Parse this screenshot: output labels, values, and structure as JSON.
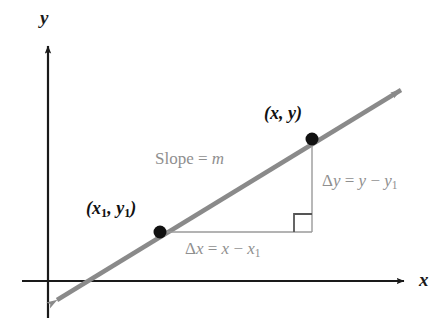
{
  "figure": {
    "background_color": "#ffffff"
  },
  "axes": {
    "x_label": "x",
    "y_label": "y",
    "axis_color": "#1a1a1a",
    "x_axis": {
      "y": 281,
      "x_start": 22,
      "x_end": 410
    },
    "y_axis": {
      "x": 48,
      "y_start": 40,
      "y_end": 318
    }
  },
  "line": {
    "color": "#8a8a8a",
    "label": "Slope = m",
    "label_prefix": "Slope =",
    "label_variable": "m",
    "arrow_both_ends": true,
    "start": {
      "x": 50,
      "y": 305
    },
    "end": {
      "x": 408,
      "y": 85
    }
  },
  "points": [
    {
      "name": "point-x1-y1",
      "label_open": "(",
      "label_x": "x",
      "label_x_sub": "1",
      "label_comma": ", ",
      "label_y": "y",
      "label_y_sub": "1",
      "label_close": ")",
      "label_text": "(x1, y1)",
      "cx": 160,
      "cy": 232,
      "r": 6,
      "color": "#111111"
    },
    {
      "name": "point-x-y",
      "label_open": "(",
      "label_x": "x",
      "label_x_sub": "",
      "label_comma": ", ",
      "label_y": "y",
      "label_y_sub": "",
      "label_close": ")",
      "label_text": "(x, y)",
      "cx": 312,
      "cy": 139,
      "r": 6,
      "color": "#111111"
    }
  ],
  "annotations": {
    "delta_y": {
      "delta": "Δ",
      "var": "y",
      "equals": " = ",
      "rhs_first": "y",
      "minus": " − ",
      "rhs_second": "y",
      "rhs_second_sub": "1",
      "text": "Δy = y − y1",
      "color": "#8f8f8f"
    },
    "delta_x": {
      "delta": "Δ",
      "var": "x",
      "equals": " = ",
      "rhs_first": "x",
      "minus": " − ",
      "rhs_second": "x",
      "rhs_second_sub": "1",
      "text": "Δx = x − x1",
      "color": "#8f8f8f"
    },
    "right_angle_marker": {
      "name": "right-angle-marker",
      "x": 294,
      "y": 213,
      "size": 18,
      "color": "#555555"
    },
    "leg_vertical": {
      "x": 312,
      "y_top": 139,
      "y_bottom": 232,
      "color": "#999999"
    },
    "leg_horizontal": {
      "y": 232,
      "x_left": 160,
      "x_right": 312,
      "color": "#999999"
    }
  }
}
